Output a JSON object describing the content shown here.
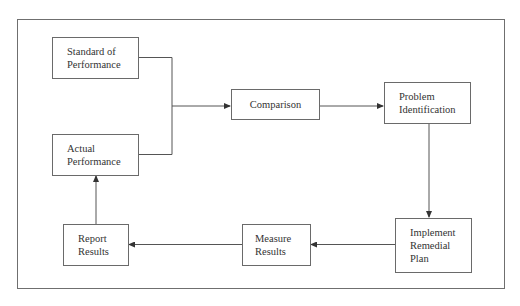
{
  "diagram": {
    "type": "flowchart",
    "nodes": {
      "standard": {
        "label": "Standard of\nPerformance"
      },
      "actual": {
        "label": "Actual\nPerformance"
      },
      "comparison": {
        "label": "Comparison"
      },
      "problem": {
        "label": "Problem\nIdentification"
      },
      "implement": {
        "label": "Implement\nRemedial\nPlan"
      },
      "measure": {
        "label": "Measure\nResults"
      },
      "report": {
        "label": "Report\nResults"
      }
    },
    "edges": [
      {
        "from": "standard",
        "to": "comparison"
      },
      {
        "from": "actual",
        "to": "comparison"
      },
      {
        "from": "comparison",
        "to": "problem"
      },
      {
        "from": "problem",
        "to": "implement"
      },
      {
        "from": "implement",
        "to": "measure"
      },
      {
        "from": "measure",
        "to": "report"
      },
      {
        "from": "report",
        "to": "actual"
      }
    ],
    "colors": {
      "line": "#555555",
      "border": "#6a6a6a",
      "text": "#333333"
    }
  }
}
